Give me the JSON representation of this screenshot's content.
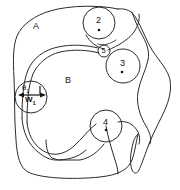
{
  "figure": {
    "background_color": "#ffffff",
    "ink_color": "#2b2b2b",
    "width": 180,
    "height": 190
  },
  "regions": [
    {
      "id": "A",
      "label": "A",
      "x": 36,
      "y": 26,
      "description": "upper-left outer region"
    },
    {
      "id": "B",
      "label": "B",
      "x": 68,
      "y": 80,
      "description": "central inner region"
    }
  ],
  "nodes": [
    {
      "id": "2",
      "label": "2",
      "cx": 99,
      "cy": 23,
      "r": 16,
      "dot": true,
      "dot_cx": 99,
      "dot_cy": 30
    },
    {
      "id": "3",
      "label": "3",
      "cx": 123,
      "cy": 66,
      "r": 17,
      "dot": true,
      "dot_cx": 122,
      "dot_cy": 72
    },
    {
      "id": "4",
      "label": "4",
      "cx": 106,
      "cy": 126,
      "r": 16,
      "dot": true,
      "dot_cx": 106,
      "dot_cy": 130
    },
    {
      "id": "5",
      "label": "5",
      "cx": 104,
      "cy": 51,
      "r": 6,
      "dot": false
    },
    {
      "id": "1",
      "label": "",
      "cx": 31,
      "cy": 97,
      "r": 16,
      "dot": false
    }
  ],
  "annotations": {
    "theta": {
      "text": "θ",
      "subscript": "1",
      "x": 23,
      "y": 88
    },
    "width": {
      "text": "W",
      "subscript": "1",
      "x": 26,
      "y": 98
    },
    "arrow_note": "double-headed horizontal arrow spanning the width W₁"
  },
  "colors": {
    "ink": "#2b2b2b",
    "label_text": "#141414",
    "paper": "#ffffff"
  }
}
